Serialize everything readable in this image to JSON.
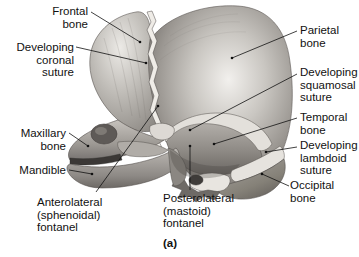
{
  "figure": {
    "caption": "(a)",
    "background_color": "#ffffff",
    "line_color": "#111111"
  },
  "labels_left": [
    {
      "id": "frontal-bone",
      "text_lines": [
        "Frontal",
        "bone"
      ],
      "x": 88,
      "y": 5,
      "align": "right"
    },
    {
      "id": "developing-coronal-suture",
      "text_lines": [
        "Developing",
        "coronal",
        "suture"
      ],
      "x": 74,
      "y": 41,
      "align": "right"
    },
    {
      "id": "maxillary-bone",
      "text_lines": [
        "Maxillary",
        "bone"
      ],
      "x": 66,
      "y": 127,
      "align": "right"
    },
    {
      "id": "mandible",
      "text_lines": [
        "Mandible"
      ],
      "x": 66,
      "y": 164,
      "align": "right"
    },
    {
      "id": "anterolateral-sphenoidal-fontanel",
      "text_lines": [
        "Anterolateral",
        "(sphenoidal)",
        "fontanel"
      ],
      "x": 37,
      "y": 196,
      "align": "left"
    }
  ],
  "labels_right": [
    {
      "id": "parietal-bone",
      "text_lines": [
        "Parietal",
        "bone"
      ],
      "x": 300,
      "y": 24,
      "align": "left"
    },
    {
      "id": "developing-squamosal-suture",
      "text_lines": [
        "Developing",
        "squamosal",
        "suture"
      ],
      "x": 300,
      "y": 66,
      "align": "left"
    },
    {
      "id": "temporal-bone",
      "text_lines": [
        "Temporal",
        "bone"
      ],
      "x": 300,
      "y": 111,
      "align": "left"
    },
    {
      "id": "developing-lambdoid-suture",
      "text_lines": [
        "Developing",
        "lambdoid",
        "suture"
      ],
      "x": 300,
      "y": 139,
      "align": "left"
    },
    {
      "id": "occipital-bone",
      "text_lines": [
        "Occipital",
        "bone"
      ],
      "x": 290,
      "y": 179,
      "align": "left"
    }
  ],
  "labels_bottom": [
    {
      "id": "posterolateral-mastoid-fontanel",
      "text_lines": [
        "Posterolateral",
        "(mastoid)",
        "fontanel"
      ],
      "x": 163,
      "y": 192,
      "align": "left"
    }
  ],
  "caption_pos": {
    "x": 163,
    "y": 237
  },
  "anatomy_colors": {
    "bone_light": "#d9d6d1",
    "bone_mid": "#a9a5a0",
    "bone_dark": "#77736f",
    "bone_shadow": "#514e4b",
    "fontanel": "#e6e3de",
    "suture": "#efece7"
  }
}
